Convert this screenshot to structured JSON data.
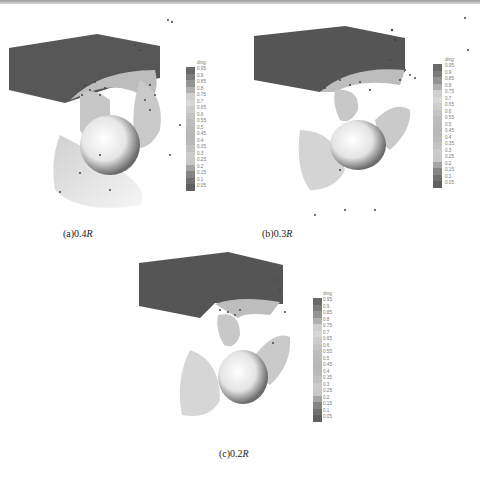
{
  "figure": {
    "panels": [
      {
        "id": "a",
        "caption_prefix": "(a)0.4",
        "caption_var": "R"
      },
      {
        "id": "b",
        "caption_prefix": "(b)0.3",
        "caption_var": "R"
      },
      {
        "id": "c",
        "caption_prefix": "(c)0.2",
        "caption_var": "R"
      }
    ],
    "colorbar": {
      "title": "dmg",
      "labels": [
        "0.95",
        "0.9",
        "0.85",
        "0.8",
        "0.75",
        "0.7",
        "0.65",
        "0.6",
        "0.55",
        "0.5",
        "0.45",
        "0.4",
        "0.35",
        "0.3",
        "0.25",
        "0.2",
        "0.15",
        "0.1",
        "0.05"
      ],
      "colors": [
        "#6a6a6a",
        "#7d7d7d",
        "#959595",
        "#b0b0b0",
        "#cfcfcf",
        "#d8d8d8",
        "#cdcdcd",
        "#c4c4c4",
        "#bdbdbd",
        "#b9b9b9",
        "#b7b7b7",
        "#bababa",
        "#c2c2c2",
        "#cbcbcb",
        "#c8c8c8",
        "#a5a5a5",
        "#858585",
        "#707070",
        "#606060"
      ]
    },
    "colors": {
      "box": "#555555",
      "hub": "#f4f4f4",
      "blade": "#c9c9c9",
      "bubbles": "#444444"
    }
  }
}
